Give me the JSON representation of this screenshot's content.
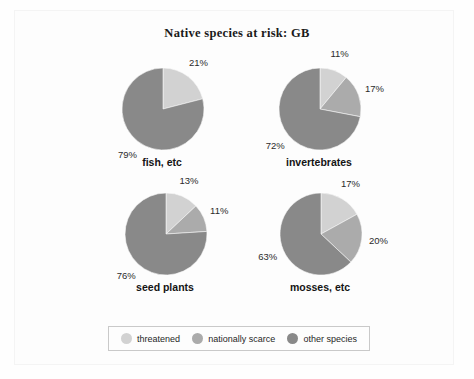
{
  "chart_data": {
    "type": "pie",
    "title": "Native species at risk: GB",
    "legend_position": "bottom",
    "legend": [
      "threatened",
      "nationally scarce",
      "other species"
    ],
    "colors": {
      "threatened": "#d2d2d2",
      "nationally_scarce": "#ababab",
      "other_species": "#898989"
    },
    "charts": [
      {
        "label": "fish, etc",
        "slices": [
          {
            "name": "threatened",
            "value": 21,
            "display": "21%"
          },
          {
            "name": "other species",
            "value": 79,
            "display": "79%"
          }
        ]
      },
      {
        "label": "invertebrates",
        "slices": [
          {
            "name": "threatened",
            "value": 11,
            "display": "11%"
          },
          {
            "name": "nationally scarce",
            "value": 17,
            "display": "17%"
          },
          {
            "name": "other species",
            "value": 72,
            "display": "72%"
          }
        ]
      },
      {
        "label": "seed plants",
        "slices": [
          {
            "name": "threatened",
            "value": 13,
            "display": "13%"
          },
          {
            "name": "nationally scarce",
            "value": 11,
            "display": "11%"
          },
          {
            "name": "other species",
            "value": 76,
            "display": "76%"
          }
        ]
      },
      {
        "label": "mosses, etc",
        "slices": [
          {
            "name": "threatened",
            "value": 17,
            "display": "17%"
          },
          {
            "name": "nationally scarce",
            "value": 20,
            "display": "20%"
          },
          {
            "name": "other species",
            "value": 63,
            "display": "63%"
          }
        ]
      }
    ]
  }
}
